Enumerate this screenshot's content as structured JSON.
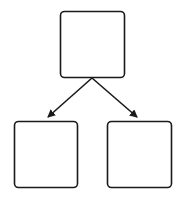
{
  "diagram": {
    "type": "tree",
    "nodes": [
      {
        "id": "root",
        "label": "",
        "x": 60,
        "y": 11,
        "w": 65,
        "h": 67
      },
      {
        "id": "left-child",
        "label": "",
        "x": 14,
        "y": 121,
        "w": 64,
        "h": 67
      },
      {
        "id": "right-child",
        "label": "",
        "x": 107,
        "y": 121,
        "w": 65,
        "h": 67
      }
    ],
    "edges": [
      {
        "from": "root",
        "to": "left-child"
      },
      {
        "from": "root",
        "to": "right-child"
      }
    ],
    "colors": {
      "stroke": "#1a1a1a",
      "fill": "#ffffff"
    }
  }
}
